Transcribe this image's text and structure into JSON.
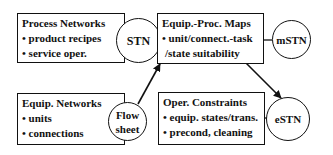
{
  "diagram": {
    "boxes": [
      {
        "id": "process-networks",
        "title": "Process Networks",
        "items": [
          "• product recipes",
          "• service oper."
        ]
      },
      {
        "id": "equip-proc-maps",
        "title": "Equip.-Proc. Maps",
        "items": [
          "• unit/connect.-task",
          "  /state suitability"
        ]
      },
      {
        "id": "equip-networks",
        "title": "Equip. Networks",
        "items": [
          "• units",
          "• connections"
        ]
      },
      {
        "id": "oper-constraints",
        "title": "Oper. Constraints",
        "items": [
          "• equip. states/trans.",
          "• precond, cleaning"
        ]
      }
    ],
    "circles": [
      {
        "id": "stn",
        "lines": [
          "STN"
        ]
      },
      {
        "id": "mstn",
        "lines": [
          "mSTN"
        ]
      },
      {
        "id": "flowsheet",
        "lines": [
          "Flow",
          "sheet"
        ]
      },
      {
        "id": "estn",
        "lines": [
          "eSTN"
        ]
      }
    ],
    "edges": [
      {
        "from": "process-networks",
        "to": "stn",
        "type": "attach"
      },
      {
        "from": "stn",
        "to": "equip-proc-maps",
        "type": "line"
      },
      {
        "from": "equip-proc-maps",
        "to": "mstn",
        "type": "line"
      },
      {
        "from": "equip-networks",
        "to": "flowsheet",
        "type": "attach"
      },
      {
        "from": "flowsheet",
        "to": "equip-proc-maps",
        "type": "arrow"
      },
      {
        "from": "equip-proc-maps",
        "to": "estn",
        "type": "arrow"
      },
      {
        "from": "oper-constraints",
        "to": "estn",
        "type": "line"
      }
    ],
    "colors": {
      "stroke": "#111111",
      "background": "#ffffff"
    }
  }
}
